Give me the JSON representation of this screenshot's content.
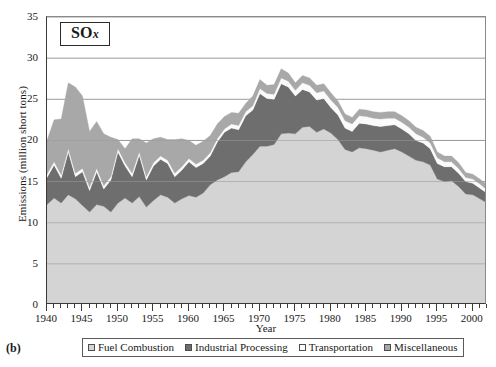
{
  "panel_id": "(b)",
  "title": {
    "text": "SO",
    "sub": "x"
  },
  "axes": {
    "ylabel": "Emissions (million short tons)",
    "xlabel": "Year",
    "yticks": [
      "0",
      "5",
      "10",
      "15",
      "20",
      "25",
      "30",
      "35"
    ],
    "xticks": [
      "1940",
      "1945",
      "1950",
      "1955",
      "1960",
      "1965",
      "1970",
      "1975",
      "1980",
      "1985",
      "1990",
      "1995",
      "2000"
    ]
  },
  "legend": {
    "items": [
      {
        "label": "Fuel Combustion",
        "color": "#d4d4d4"
      },
      {
        "label": "Industrial Processing",
        "color": "#6e6e6e"
      },
      {
        "label": "Transportation",
        "color": "#fbfbfb"
      },
      {
        "label": "Miscellaneous",
        "color": "#a8a8a8"
      }
    ]
  },
  "chart_data": {
    "type": "area",
    "stacked": true,
    "title": "SOx",
    "xlabel": "Year",
    "ylabel": "Emissions (million short tons)",
    "xlim": [
      1940,
      2002
    ],
    "ylim": [
      0,
      35
    ],
    "grid": "horizontal",
    "legend_position": "bottom",
    "x": [
      1940,
      1941,
      1942,
      1943,
      1944,
      1945,
      1946,
      1947,
      1948,
      1949,
      1950,
      1951,
      1952,
      1953,
      1954,
      1955,
      1956,
      1957,
      1958,
      1959,
      1960,
      1961,
      1962,
      1963,
      1964,
      1965,
      1966,
      1967,
      1968,
      1969,
      1970,
      1971,
      1972,
      1973,
      1974,
      1975,
      1976,
      1977,
      1978,
      1979,
      1980,
      1981,
      1982,
      1983,
      1984,
      1985,
      1986,
      1987,
      1988,
      1989,
      1990,
      1991,
      1992,
      1993,
      1994,
      1995,
      1996,
      1997,
      1998,
      1999,
      2000,
      2001,
      2002
    ],
    "series": [
      {
        "name": "Fuel Combustion",
        "color": "#d4d4d4",
        "values": [
          12.2,
          13.0,
          12.4,
          13.4,
          12.9,
          12.1,
          11.3,
          12.2,
          12.0,
          11.3,
          12.4,
          13.0,
          12.4,
          13.2,
          11.9,
          12.7,
          13.4,
          13.1,
          12.4,
          12.9,
          13.3,
          13.1,
          13.6,
          14.6,
          15.2,
          15.6,
          16.1,
          16.2,
          17.4,
          18.3,
          19.3,
          19.3,
          19.5,
          20.8,
          20.9,
          20.8,
          21.6,
          21.7,
          21.0,
          21.4,
          20.9,
          20.1,
          18.9,
          18.6,
          19.1,
          19.0,
          18.8,
          18.6,
          18.8,
          19.0,
          18.6,
          18.1,
          17.6,
          17.4,
          17.0,
          15.3,
          15.0,
          15.1,
          14.4,
          13.5,
          13.4,
          12.9,
          12.4
        ]
      },
      {
        "name": "Industrial Processing",
        "color": "#6e6e6e",
        "values": [
          3.3,
          4.0,
          3.0,
          5.2,
          2.7,
          4.1,
          2.6,
          4.0,
          2.1,
          3.9,
          6.2,
          3.9,
          3.2,
          5.0,
          3.3,
          4.2,
          4.3,
          4.1,
          3.2,
          3.5,
          4.1,
          3.6,
          3.6,
          3.5,
          4.6,
          5.4,
          5.4,
          5.1,
          5.6,
          5.4,
          6.4,
          5.8,
          5.5,
          6.1,
          5.6,
          4.6,
          4.6,
          4.2,
          3.9,
          3.7,
          3.1,
          3.0,
          2.6,
          2.5,
          3.0,
          3.0,
          3.0,
          3.1,
          3.0,
          2.9,
          2.8,
          2.7,
          2.4,
          2.3,
          2.0,
          1.9,
          1.8,
          1.7,
          1.6,
          1.5,
          1.4,
          1.3,
          1.2
        ]
      },
      {
        "name": "Transportation",
        "color": "#fbfbfb",
        "values": [
          0.4,
          0.4,
          0.4,
          0.4,
          0.4,
          0.4,
          0.4,
          0.4,
          0.4,
          0.4,
          0.4,
          0.4,
          0.4,
          0.4,
          0.4,
          0.4,
          0.4,
          0.4,
          0.4,
          0.4,
          0.4,
          0.4,
          0.4,
          0.4,
          0.4,
          0.4,
          0.5,
          0.5,
          0.5,
          0.5,
          0.6,
          0.6,
          0.6,
          0.7,
          0.7,
          0.7,
          0.8,
          0.8,
          0.9,
          0.9,
          0.9,
          0.9,
          0.9,
          0.9,
          0.9,
          0.9,
          0.9,
          0.9,
          0.9,
          0.8,
          0.8,
          0.8,
          0.8,
          0.7,
          0.7,
          0.7,
          0.6,
          0.6,
          0.6,
          0.5,
          0.5,
          0.5,
          0.4
        ]
      },
      {
        "name": "Miscellaneous",
        "color": "#a8a8a8",
        "values": [
          4.1,
          5.1,
          6.8,
          8.0,
          10.5,
          8.8,
          6.8,
          5.7,
          6.3,
          4.8,
          1.1,
          1.7,
          4.2,
          1.6,
          4.1,
          2.9,
          2.3,
          2.5,
          4.1,
          3.4,
          2.2,
          2.3,
          2.3,
          2.1,
          1.8,
          1.5,
          1.4,
          1.5,
          1.0,
          1.2,
          1.1,
          1.0,
          1.2,
          1.1,
          1.0,
          0.9,
          0.9,
          0.9,
          0.9,
          0.9,
          0.9,
          0.8,
          0.8,
          0.8,
          0.8,
          0.8,
          0.8,
          0.8,
          0.8,
          0.8,
          0.8,
          0.8,
          0.8,
          0.8,
          0.8,
          0.7,
          0.7,
          0.7,
          0.7,
          0.6,
          0.6,
          0.6,
          0.6
        ]
      }
    ]
  }
}
